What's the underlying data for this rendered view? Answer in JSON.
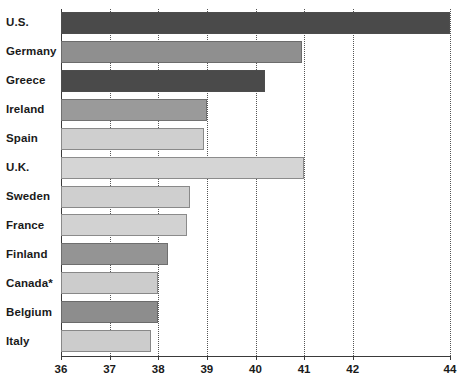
{
  "chart_data": {
    "type": "bar",
    "orientation": "horizontal",
    "title": "",
    "subtitle": "",
    "xlabel": "",
    "ylabel": "",
    "xlim": [
      36,
      44
    ],
    "ylim": null,
    "grid": true,
    "legend": null,
    "legend_position": "none",
    "tick_labels": [
      "36",
      "37",
      "38",
      "39",
      "40",
      "41",
      "42",
      "44"
    ],
    "tick_values": [
      36,
      37,
      38,
      39,
      40,
      41,
      42,
      44
    ],
    "categories": [
      "U.S.",
      "Germany",
      "Greece",
      "Ireland",
      "Spain",
      "U.K.",
      "Sweden",
      "France",
      "Finland",
      "Canada*",
      "Belgium",
      "Italy"
    ],
    "values": [
      44.0,
      40.95,
      40.2,
      39.0,
      38.95,
      41.0,
      38.65,
      38.6,
      38.2,
      38.0,
      38.0,
      37.85
    ],
    "bar_colors": [
      "#4a4a4a",
      "#8f8f8f",
      "#4a4a4a",
      "#9a9a9a",
      "#cfcfcf",
      "#d5d5d5",
      "#cfcfcf",
      "#d2d2d2",
      "#949494",
      "#cccccc",
      "#8d8d8d",
      "#cccccc"
    ],
    "annotations": [
      "Canada*"
    ]
  },
  "colors": {
    "dark_gray": "#4a4a4a",
    "medium_gray": "#8f8f8f",
    "light_gray": "#cfcfcf",
    "axis": "#3a3a3a",
    "gridline": "#555555",
    "background": "#ffffff",
    "text": "#1a1a1a"
  }
}
